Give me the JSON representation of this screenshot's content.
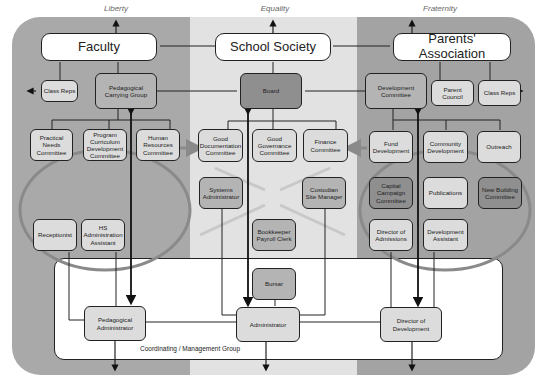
{
  "columns": [
    {
      "label": "Liberty",
      "x": 58,
      "color": "#a9a9a9"
    },
    {
      "label": "Equality",
      "x": 216,
      "color": "#e0e0e0"
    },
    {
      "label": "Fraternity",
      "x": 380,
      "color": "#a0a0a0"
    }
  ],
  "primary": {
    "faculty": "Faculty",
    "school_society": "School Society",
    "parents_association": "Parents' Association"
  },
  "faculty_group": {
    "class_reps": "Class Reps",
    "pedagogical_carrying_group": "Pedagogical Carrying Group",
    "practical_needs": "Practical Needs Committee",
    "program_curriculum": "Program Curriculum Development Committee",
    "human_resources": "Human Resources Committee",
    "receptionist": "Receptionist",
    "hs_admin_assistant": "HS Administration Assistant"
  },
  "society_group": {
    "board": "Board",
    "good_documentation": "Good Documentation Committee",
    "good_governance": "Good Governance Committee",
    "finance": "Finance Committee",
    "systems_admin": "Systems Administrator",
    "custodian": "Custodian Site Manager",
    "bookkeeper": "Bookkeeper Payroll Clerk",
    "bursar": "Bursar"
  },
  "parents_group": {
    "development_committee": "Development Committee",
    "parent_council": "Parent Council",
    "class_reps": "Class Reps",
    "fund_development": "Fund Development",
    "community_development": "Community Development",
    "outreach": "Outreach",
    "capital_campaign": "Capital Campaign Committee",
    "publications": "Publications",
    "new_building": "New Building Committee",
    "director_admissions": "Director of Admissions",
    "development_assistant": "Development Assistant"
  },
  "coordinating": {
    "label": "Coordinating / Management Group",
    "pedagogical_admin": "Pedagogical Administrator",
    "administrator": "Administrator",
    "director_development": "Director of Development"
  }
}
